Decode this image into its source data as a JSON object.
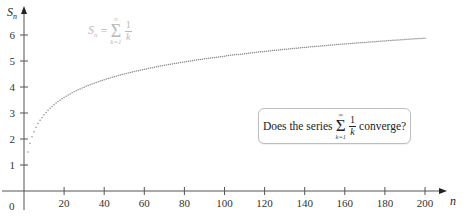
{
  "chart_data": {
    "type": "scatter",
    "title": "",
    "xlabel": "n",
    "ylabel": "S_n",
    "xlim": [
      0,
      210
    ],
    "ylim": [
      0,
      6.8
    ],
    "grid": false,
    "legend": null,
    "x_ticks": [
      20,
      40,
      60,
      80,
      100,
      120,
      140,
      160,
      180,
      200
    ],
    "y_ticks": [
      1,
      2,
      3,
      4,
      5,
      6
    ],
    "origin_label": "0",
    "series": [
      {
        "name": "S_n = sum_{k=1}^{n} 1/k",
        "formula": "harmonic_partial_sums",
        "n_start": 1,
        "n_end": 200,
        "sample_values": {
          "1": 1.0,
          "2": 1.5,
          "5": 2.283,
          "10": 2.929,
          "20": 3.598,
          "40": 4.279,
          "60": 4.68,
          "80": 4.965,
          "100": 5.187,
          "120": 5.369,
          "140": 5.523,
          "160": 5.656,
          "180": 5.774,
          "200": 5.878
        },
        "color": "#8a8a8a",
        "marker": "dot"
      }
    ],
    "annotations": [
      {
        "type": "formula-label",
        "text": "S_n = Σ_{k=1}^{n} 1/k",
        "color": "#b9b9b9"
      },
      {
        "type": "callout-box",
        "text": "Does the series Σ_{k=1}^{∞} 1/k converge?"
      }
    ]
  },
  "labels": {
    "y_axis": "S",
    "y_axis_sub": "n",
    "x_axis": "n",
    "origin": "0"
  },
  "formula_label": {
    "lhs": "S",
    "lhs_sub": "n",
    "eq": "=",
    "sigma": "Σ",
    "upper": "n",
    "lower": "k=1",
    "num": "1",
    "den": "k"
  },
  "question": {
    "prefix": "Does the series",
    "sigma": "Σ",
    "upper": "∞",
    "lower": "k=1",
    "num": "1",
    "den": "k",
    "suffix": "converge?"
  }
}
